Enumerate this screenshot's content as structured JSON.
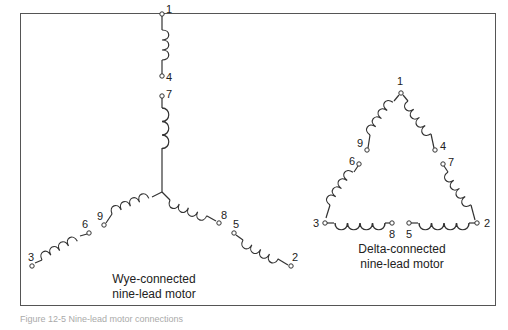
{
  "diagram": {
    "wye": {
      "title_line1": "Wye-connected",
      "title_line2": "nine-lead motor",
      "terminals": [
        "1",
        "4",
        "7",
        "9",
        "6",
        "3",
        "8",
        "5",
        "2"
      ]
    },
    "delta": {
      "title_line1": "Delta-connected",
      "title_line2": "nine-lead motor",
      "terminals": [
        "1",
        "9",
        "4",
        "6",
        "7",
        "3",
        "8",
        "5",
        "2"
      ]
    },
    "caption": "Figure 12-5 Nine-lead motor connections"
  }
}
